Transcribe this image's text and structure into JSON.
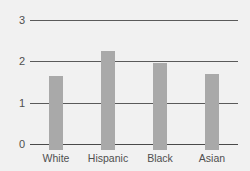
{
  "chart_data": {
    "type": "bar",
    "title": "",
    "subtitle": "",
    "xlabel": "",
    "ylabel": "",
    "categories": [
      "White",
      "Hispanic",
      "Black",
      "Asian"
    ],
    "values": [
      1.8,
      2.4,
      2.1,
      1.85
    ],
    "ylim": [
      0,
      3
    ],
    "yticks": [
      0,
      1,
      2,
      3
    ],
    "ytick_labels": [
      "0",
      "1",
      "2",
      "3"
    ],
    "grid": true,
    "legend": null,
    "annotations": [],
    "colors": {
      "bar_fill": "#a9a9a9",
      "gridline": "#5a5a5a",
      "axis": "#4a4a4a",
      "text": "#4f4f4f",
      "background": "#f1f1f1"
    }
  }
}
